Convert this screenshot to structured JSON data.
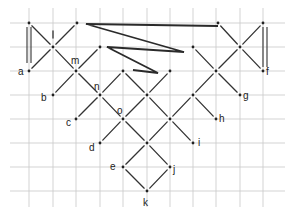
{
  "diagram": {
    "grid": {
      "x": [
        29,
        53,
        76,
        100,
        123,
        147,
        170,
        193,
        216,
        240,
        263
      ],
      "y": [
        23,
        47,
        71,
        95,
        119,
        143,
        167,
        191
      ],
      "x_range": [
        10,
        285
      ],
      "y_range": [
        8,
        207
      ],
      "color": "#c8c8c8"
    },
    "labels": [
      {
        "id": "a",
        "text": "a",
        "x": 18,
        "y": 75
      },
      {
        "id": "m",
        "text": "m",
        "x": 71,
        "y": 64
      },
      {
        "id": "b",
        "text": "b",
        "x": 41,
        "y": 101
      },
      {
        "id": "n",
        "text": "n",
        "x": 94,
        "y": 90
      },
      {
        "id": "c",
        "text": "c",
        "x": 66,
        "y": 126
      },
      {
        "id": "o",
        "text": "o",
        "x": 117,
        "y": 114
      },
      {
        "id": "d",
        "text": "d",
        "x": 89,
        "y": 151
      },
      {
        "id": "e",
        "text": "e",
        "x": 110,
        "y": 170
      },
      {
        "id": "j",
        "text": "j",
        "x": 173,
        "y": 173
      },
      {
        "id": "k",
        "text": "k",
        "x": 143,
        "y": 206
      },
      {
        "id": "i",
        "text": "i",
        "x": 198,
        "y": 146
      },
      {
        "id": "h",
        "text": "h",
        "x": 219,
        "y": 122
      },
      {
        "id": "g",
        "text": "g",
        "x": 243,
        "y": 99
      },
      {
        "id": "f",
        "text": "f",
        "x": 266,
        "y": 75
      }
    ],
    "points": [
      [
        29,
        23
      ],
      [
        77,
        23
      ],
      [
        53,
        47
      ],
      [
        29,
        71
      ],
      [
        76,
        71
      ],
      [
        100,
        47
      ],
      [
        53,
        95
      ],
      [
        100,
        95
      ],
      [
        123,
        71
      ],
      [
        170,
        71
      ],
      [
        147,
        95
      ],
      [
        76,
        119
      ],
      [
        123,
        119
      ],
      [
        170,
        119
      ],
      [
        100,
        143
      ],
      [
        147,
        143
      ],
      [
        193,
        143
      ],
      [
        123,
        167
      ],
      [
        170,
        167
      ],
      [
        147,
        191
      ],
      [
        193,
        47
      ],
      [
        216,
        71
      ],
      [
        193,
        95
      ],
      [
        240,
        95
      ],
      [
        216,
        119
      ],
      [
        218,
        23
      ],
      [
        263,
        23
      ],
      [
        240,
        47
      ],
      [
        263,
        71
      ]
    ],
    "edges": [
      [
        29,
        23,
        53,
        47
      ],
      [
        77,
        23,
        53,
        47
      ],
      [
        53,
        47,
        29,
        71
      ],
      [
        53,
        47,
        76,
        71
      ],
      [
        100,
        47,
        76,
        71
      ],
      [
        76,
        71,
        53,
        95
      ],
      [
        76,
        71,
        100,
        95
      ],
      [
        123,
        71,
        100,
        95
      ],
      [
        100,
        95,
        76,
        119
      ],
      [
        100,
        95,
        123,
        119
      ],
      [
        123,
        71,
        147,
        95
      ],
      [
        170,
        71,
        147,
        95
      ],
      [
        147,
        95,
        123,
        119
      ],
      [
        147,
        95,
        170,
        119
      ],
      [
        123,
        119,
        100,
        143
      ],
      [
        123,
        119,
        147,
        143
      ],
      [
        170,
        119,
        147,
        143
      ],
      [
        170,
        119,
        193,
        143
      ],
      [
        147,
        143,
        123,
        167
      ],
      [
        147,
        143,
        170,
        167
      ],
      [
        123,
        167,
        147,
        191
      ],
      [
        170,
        167,
        147,
        191
      ],
      [
        193,
        47,
        216,
        71
      ],
      [
        216,
        71,
        193,
        95
      ],
      [
        216,
        71,
        240,
        95
      ],
      [
        193,
        95,
        170,
        119
      ],
      [
        193,
        95,
        216,
        119
      ],
      [
        218,
        23,
        240,
        47
      ],
      [
        263,
        23,
        240,
        47
      ],
      [
        240,
        47,
        216,
        71
      ],
      [
        240,
        47,
        263,
        71
      ],
      [
        53,
        29,
        53,
        40
      ]
    ],
    "zigzag": "86,24 218,26 86,24 184,52 107,47 158,73 133,70",
    "double_bars": [
      {
        "x1": 27,
        "x2": 31,
        "y1": 27,
        "y2": 63
      },
      {
        "x1": 263,
        "x2": 267,
        "y1": 27,
        "y2": 67
      }
    ]
  }
}
